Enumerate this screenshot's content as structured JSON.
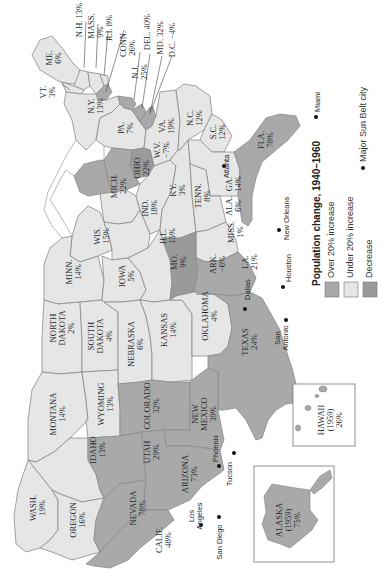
{
  "map": {
    "orientation": "rotated 90 degrees clockwise (north to the left)",
    "legend": {
      "title": "Population change, 1940–1960",
      "items": [
        {
          "label": "Over 20% increase",
          "color": "#a9a9a9"
        },
        {
          "label": "Under 20% increase",
          "color": "#e6e6e6"
        },
        {
          "label": "Decrease",
          "color": "#9a9a9a"
        }
      ],
      "city_marker_label": "Major Sun Belt city"
    },
    "colors": {
      "over20": "#a9a9a9",
      "under20": "#e6e6e6",
      "decrease": "#9a9a9a",
      "border": "#8a8a8a",
      "water": "#ffffff"
    },
    "states": {
      "me": {
        "name": "ME.",
        "value": "6%",
        "category": "under20"
      },
      "nh": {
        "name": "N.H.",
        "value": "13%",
        "category": "under20"
      },
      "vt": {
        "name": "VT.",
        "value": "3%",
        "category": "under20"
      },
      "mass": {
        "name": "MASS.",
        "value": "9%",
        "category": "under20"
      },
      "ri": {
        "name": "R.I.",
        "value": "8%",
        "category": "under20"
      },
      "conn": {
        "name": "CONN.",
        "value": "26%",
        "category": "over20"
      },
      "nj": {
        "name": "N.J.",
        "value": "25%",
        "category": "over20"
      },
      "del": {
        "name": "DEL.",
        "value": "40%",
        "category": "over20"
      },
      "md": {
        "name": "MD.",
        "value": "32%",
        "category": "over20"
      },
      "dc": {
        "name": "D.C.",
        "value": "−4%",
        "category": "decrease"
      },
      "ny": {
        "name": "N.Y.",
        "value": "13%",
        "category": "under20"
      },
      "pa": {
        "name": "PA.",
        "value": "7%",
        "category": "under20"
      },
      "va": {
        "name": "VA.",
        "value": "19%",
        "category": "under20"
      },
      "wv": {
        "name": "W.V.",
        "value": "−7%",
        "category": "decrease"
      },
      "nc": {
        "name": "N.C.",
        "value": "12%",
        "category": "under20"
      },
      "sc": {
        "name": "S.C.",
        "value": "12%",
        "category": "under20"
      },
      "ga": {
        "name": "GA.",
        "value": "14%",
        "category": "under20"
      },
      "fla": {
        "name": "FLA.",
        "value": "78%",
        "category": "over20"
      },
      "ohio": {
        "name": "OHIO",
        "value": "22%",
        "category": "over20"
      },
      "mich": {
        "name": "MICH.",
        "value": "22%",
        "category": "over20"
      },
      "ind": {
        "name": "IND.",
        "value": "18%",
        "category": "under20"
      },
      "ky": {
        "name": "KY.",
        "value": "3%",
        "category": "under20"
      },
      "tenn": {
        "name": "TENN.",
        "value": "8%",
        "category": "under20"
      },
      "ala": {
        "name": "ALA.",
        "value": "6%",
        "category": "under20"
      },
      "miss": {
        "name": "MISS.",
        "value": "1%",
        "category": "under20"
      },
      "wis": {
        "name": "WIS.",
        "value": "15%",
        "category": "under20"
      },
      "ill": {
        "name": "ILL.",
        "value": "15%",
        "category": "under20"
      },
      "minn": {
        "name": "MINN.",
        "value": "14%",
        "category": "under20"
      },
      "iowa": {
        "name": "IOWA",
        "value": "5%",
        "category": "under20"
      },
      "mo": {
        "name": "MO.",
        "value": "9%",
        "category": "under20"
      },
      "ark": {
        "name": "ARK.",
        "value": "−6%",
        "category": "decrease"
      },
      "la": {
        "name": "LA.",
        "value": "21%",
        "category": "over20"
      },
      "nd": {
        "name": "NORTH DAKOTA",
        "line1": "NORTH",
        "line2": "DAKOTA",
        "value": "2%",
        "category": "under20"
      },
      "sd": {
        "name": "SOUTH DAKOTA",
        "line1": "SOUTH",
        "line2": "DAKOTA",
        "value": "4%",
        "category": "under20"
      },
      "neb": {
        "name": "NEBRASKA",
        "value": "6%",
        "category": "under20"
      },
      "kan": {
        "name": "KANSAS",
        "value": "14%",
        "category": "under20"
      },
      "okla": {
        "name": "OKLAHOMA",
        "value": "4%",
        "category": "under20"
      },
      "tex": {
        "name": "TEXAS",
        "value": "24%",
        "category": "over20"
      },
      "mont": {
        "name": "MONTANA",
        "value": "14%",
        "category": "under20"
      },
      "wyo": {
        "name": "WYOMING",
        "value": "13%",
        "category": "under20"
      },
      "colo": {
        "name": "COLORADO",
        "value": "32%",
        "category": "over20"
      },
      "nm": {
        "name": "NEW MEXICO",
        "line1": "NEW",
        "line2": "MEXICO",
        "value": "39%",
        "category": "over20"
      },
      "idaho": {
        "name": "IDAHO",
        "value": "13%",
        "category": "under20"
      },
      "utah": {
        "name": "UTAH",
        "value": "29%",
        "category": "over20"
      },
      "ariz": {
        "name": "ARIZONA",
        "value": "73%",
        "category": "over20"
      },
      "wash": {
        "name": "WASH.",
        "value": "19%",
        "category": "under20"
      },
      "ore": {
        "name": "OREGON",
        "value": "16%",
        "category": "under20"
      },
      "nev": {
        "name": "NEVADA",
        "value": "78%",
        "category": "over20"
      },
      "calif": {
        "name": "CALIF.",
        "value": "48%",
        "category": "over20"
      },
      "alaska": {
        "name": "ALASKA",
        "year": "(1959)",
        "value": "75%",
        "category": "over20"
      },
      "hawaii": {
        "name": "HAWAII",
        "year": "(1959)",
        "value": "26%",
        "category": "over20"
      }
    },
    "cities": [
      {
        "name": "Miami"
      },
      {
        "name": "Atlanta"
      },
      {
        "name": "New Orleans"
      },
      {
        "name": "Houston"
      },
      {
        "name": "Dallas"
      },
      {
        "name": "San Antonio",
        "line1": "San",
        "line2": "Antonio"
      },
      {
        "name": "Phoenix"
      },
      {
        "name": "Tucson"
      },
      {
        "name": "Los Angeles",
        "line1": "Los",
        "line2": "Angeles"
      },
      {
        "name": "San Diego"
      }
    ]
  }
}
